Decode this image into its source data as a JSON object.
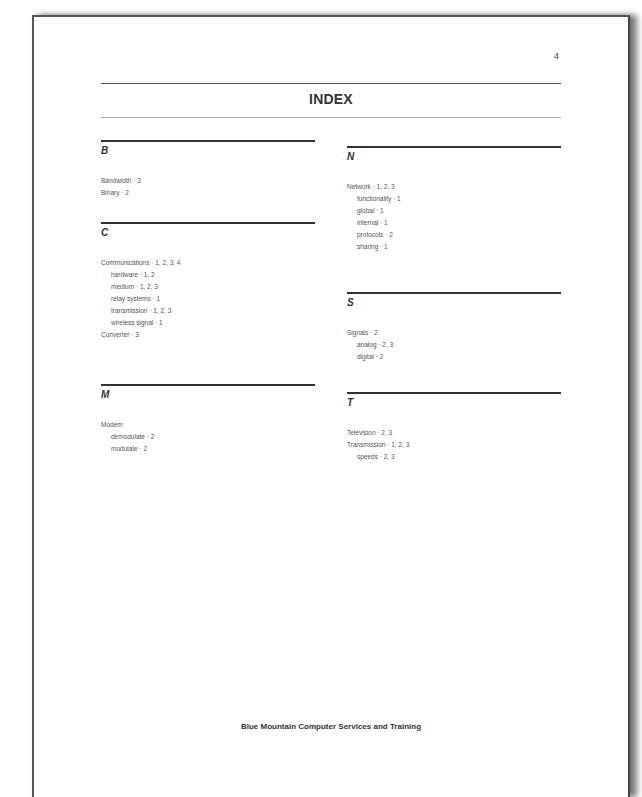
{
  "page": {
    "number": "4",
    "title": "INDEX",
    "footer": "Blue Mountain Computer Services and Training"
  },
  "sections": {
    "B": {
      "letter": "B",
      "entries": [
        {
          "text": "Bandwidth · 3",
          "level": 0
        },
        {
          "text": "Binary · 2",
          "level": 0
        }
      ]
    },
    "C": {
      "letter": "C",
      "entries": [
        {
          "text": "Communications · 1, 2, 3, 4",
          "level": 0
        },
        {
          "text": "hardware · 1, 2",
          "level": 1
        },
        {
          "text": "medium · 1, 2, 3",
          "level": 1
        },
        {
          "text": "relay systems · 1",
          "level": 1
        },
        {
          "text": "transmission · 1, 2, 3",
          "level": 1
        },
        {
          "text": "wireless signal · 1",
          "level": 1
        },
        {
          "text": "Converter · 3",
          "level": 0
        }
      ]
    },
    "M": {
      "letter": "M",
      "entries": [
        {
          "text": "Modem",
          "level": 0
        },
        {
          "text": "demodulate · 2",
          "level": 1
        },
        {
          "text": "modulate · 2",
          "level": 1
        }
      ]
    },
    "N": {
      "letter": "N",
      "entries": [
        {
          "text": "Network · 1, 2, 3",
          "level": 0
        },
        {
          "text": "functionality · 1",
          "level": 1
        },
        {
          "text": "global · 1",
          "level": 1
        },
        {
          "text": "internal · 1",
          "level": 1
        },
        {
          "text": "protocols · 2",
          "level": 1
        },
        {
          "text": "sharing · 1",
          "level": 1
        }
      ]
    },
    "S": {
      "letter": "S",
      "entries": [
        {
          "text": "Signals · 2",
          "level": 0
        },
        {
          "text": "analog · 2, 3",
          "level": 1
        },
        {
          "text": "digital · 2",
          "level": 1
        }
      ]
    },
    "T": {
      "letter": "T",
      "entries": [
        {
          "text": "Television · 2, 3",
          "level": 0
        },
        {
          "text": "Transmission · 1, 2, 3",
          "level": 0
        },
        {
          "text": "speeds · 2, 3",
          "level": 1
        }
      ]
    }
  }
}
